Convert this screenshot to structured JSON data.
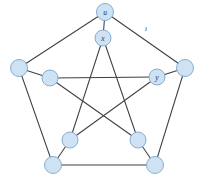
{
  "figure": {
    "name": "petersen-graph",
    "background_color": "#ffffff",
    "node_fill": "#cfe2f3",
    "node_stroke": "#7ba7cc",
    "edge_color": "#3f3f46",
    "label_color": "#16314d"
  },
  "nodes": [
    {
      "id": "u",
      "label": "u",
      "cx": 105,
      "cy": 12,
      "r": 8.5,
      "ring": "outer"
    },
    {
      "id": "o2",
      "label": "",
      "cx": 185,
      "cy": 68,
      "r": 8.5,
      "ring": "outer"
    },
    {
      "id": "o3",
      "label": "",
      "cx": 155,
      "cy": 165,
      "r": 8.5,
      "ring": "outer"
    },
    {
      "id": "o4",
      "label": "",
      "cx": 53,
      "cy": 165,
      "r": 8.5,
      "ring": "outer"
    },
    {
      "id": "o5",
      "label": "",
      "cx": 19,
      "cy": 68,
      "r": 8.5,
      "ring": "outer"
    },
    {
      "id": "x",
      "label": "x",
      "cx": 103,
      "cy": 38,
      "r": 8.0,
      "ring": "inner"
    },
    {
      "id": "y",
      "label": "y",
      "cx": 157,
      "cy": 77,
      "r": 8.0,
      "ring": "inner"
    },
    {
      "id": "i3",
      "label": "",
      "cx": 138,
      "cy": 140,
      "r": 8.0,
      "ring": "inner"
    },
    {
      "id": "i4",
      "label": "",
      "cx": 70,
      "cy": 140,
      "r": 8.0,
      "ring": "inner"
    },
    {
      "id": "i5",
      "label": "",
      "cx": 50,
      "cy": 78,
      "r": 8.0,
      "ring": "inner"
    }
  ],
  "edges": [
    {
      "from": "u",
      "to": "o2",
      "kind": "outer-cycle"
    },
    {
      "from": "o2",
      "to": "o3",
      "kind": "outer-cycle"
    },
    {
      "from": "o3",
      "to": "o4",
      "kind": "outer-cycle"
    },
    {
      "from": "o4",
      "to": "o5",
      "kind": "outer-cycle"
    },
    {
      "from": "o5",
      "to": "u",
      "kind": "outer-cycle"
    },
    {
      "from": "u",
      "to": "x",
      "kind": "spoke"
    },
    {
      "from": "o2",
      "to": "y",
      "kind": "spoke"
    },
    {
      "from": "o3",
      "to": "i3",
      "kind": "spoke"
    },
    {
      "from": "o4",
      "to": "i4",
      "kind": "spoke"
    },
    {
      "from": "o5",
      "to": "i5",
      "kind": "spoke"
    },
    {
      "from": "x",
      "to": "i3",
      "kind": "inner-star"
    },
    {
      "from": "i3",
      "to": "i5",
      "kind": "inner-star"
    },
    {
      "from": "i5",
      "to": "y",
      "kind": "inner-star"
    },
    {
      "from": "y",
      "to": "i4",
      "kind": "inner-star"
    },
    {
      "from": "i4",
      "to": "x",
      "kind": "inner-star"
    }
  ],
  "edge_labels": [
    {
      "id": "i",
      "text": "i",
      "x": 146,
      "y": 29,
      "for_edge": "u-o2"
    }
  ]
}
